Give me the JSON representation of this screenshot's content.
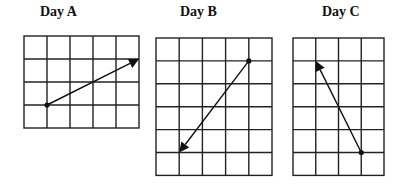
{
  "panels": [
    {
      "id": "day-a",
      "title": "Day A",
      "title_x": 40,
      "grid": {
        "x": 24,
        "y": 36,
        "cols": 5,
        "rows": 4,
        "cell_w": 23,
        "cell_h": 23
      },
      "vector": {
        "start": [
          1,
          3
        ],
        "end": [
          5,
          1
        ]
      }
    },
    {
      "id": "day-b",
      "title": "Day B",
      "title_x": 180,
      "grid": {
        "x": 156,
        "y": 38,
        "cols": 5,
        "rows": 6,
        "cell_w": 23.2,
        "cell_h": 22.9
      },
      "vector": {
        "start": [
          4,
          1
        ],
        "end": [
          1,
          5
        ]
      }
    },
    {
      "id": "day-c",
      "title": "Day C",
      "title_x": 322,
      "grid": {
        "x": 293,
        "y": 38,
        "cols": 4,
        "rows": 6,
        "cell_w": 22.75,
        "cell_h": 22.9
      },
      "vector": {
        "start": [
          3,
          5
        ],
        "end": [
          1,
          1
        ]
      }
    }
  ],
  "colors": {
    "ink": "#111111",
    "background": "#ffffff"
  }
}
